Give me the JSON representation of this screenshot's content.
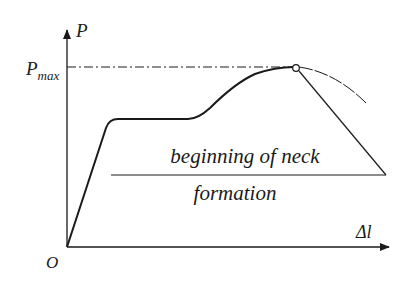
{
  "diagram": {
    "type": "load-elongation curve",
    "axes": {
      "y_label": "P",
      "x_label": "Δl",
      "origin_label": "O",
      "pmax_label_main": "P",
      "pmax_label_sub": "max"
    },
    "annotation": {
      "line1": "beginning of neck",
      "line2": "formation"
    },
    "colors": {
      "stroke": "#1a1a1a",
      "background": "#ffffff"
    }
  }
}
